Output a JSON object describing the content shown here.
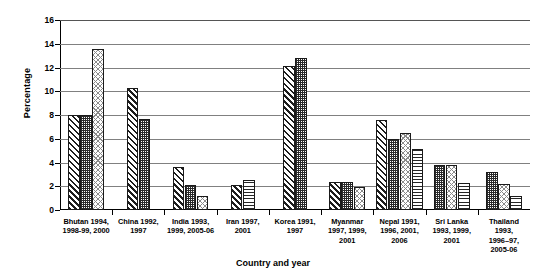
{
  "chart_data": {
    "type": "bar",
    "title": "",
    "xlabel": "Country and year",
    "ylabel": "Percentage",
    "ylim": [
      0,
      16
    ],
    "ytick_values": [
      0,
      2,
      4,
      6,
      8,
      10,
      12,
      14,
      16
    ],
    "ytick_labels": [
      "0",
      "2",
      "4",
      "6",
      "8",
      "10",
      "12",
      "14",
      "16"
    ],
    "grid": true,
    "legend": "none",
    "categories": [
      "Bhutan 1994, 1998-99, 2000",
      "China 1992, 1997",
      "India 1993, 1999, 2005-06",
      "Iran 1997, 2001",
      "Korea 1991, 1997",
      "Myanmar 1997, 1999, 2001",
      "Nepal 1991, 1996, 2001, 2006",
      "Sri Lanka 1993, 1999, 2001",
      "Thailand 1993, 1996–97, 2005-06"
    ],
    "category_label_lines": [
      [
        "Bhutan 1994,",
        "1998-99, 2000"
      ],
      [
        "China 1992,",
        "1997"
      ],
      [
        "India 1993,",
        "1999, 2005-06"
      ],
      [
        "Iran 1997,",
        "2001"
      ],
      [
        "Korea 1991,",
        "1997"
      ],
      [
        "Myanmar",
        "1997, 1999,",
        "2001"
      ],
      [
        "Nepal 1991,",
        "1996, 2001,",
        "2006"
      ],
      [
        "Sri Lanka",
        "1993, 1999,",
        "2001"
      ],
      [
        "Thailand",
        "1993,",
        "1996–97,",
        "2005-06"
      ]
    ],
    "groups": [
      {
        "category": "Bhutan 1994, 1998-99, 2000",
        "bars": [
          {
            "value": 8.0,
            "pattern": "diagonal-hatch"
          },
          {
            "value": 8.0,
            "pattern": "checkerboard"
          },
          {
            "value": 13.6,
            "pattern": "light-crosshatch"
          }
        ]
      },
      {
        "category": "China 1992, 1997",
        "bars": [
          {
            "value": 10.3,
            "pattern": "diagonal-hatch"
          },
          {
            "value": 7.7,
            "pattern": "checkerboard"
          }
        ]
      },
      {
        "category": "India 1993, 1999, 2005-06",
        "bars": [
          {
            "value": 3.6,
            "pattern": "diagonal-hatch"
          },
          {
            "value": 2.1,
            "pattern": "checkerboard"
          },
          {
            "value": 1.2,
            "pattern": "light-crosshatch"
          }
        ]
      },
      {
        "category": "Iran 1997, 2001",
        "bars": [
          {
            "value": 2.1,
            "pattern": "diagonal-hatch"
          },
          {
            "value": 2.5,
            "pattern": "horizontal-lines"
          }
        ]
      },
      {
        "category": "Korea 1991, 1997",
        "bars": [
          {
            "value": 12.1,
            "pattern": "diagonal-hatch"
          },
          {
            "value": 12.8,
            "pattern": "checkerboard"
          }
        ]
      },
      {
        "category": "Myanmar 1997, 1999, 2001",
        "bars": [
          {
            "value": 2.4,
            "pattern": "diagonal-hatch"
          },
          {
            "value": 2.4,
            "pattern": "checkerboard"
          },
          {
            "value": 1.9,
            "pattern": "light-crosshatch"
          }
        ]
      },
      {
        "category": "Nepal 1991, 1996, 2001, 2006",
        "bars": [
          {
            "value": 7.6,
            "pattern": "diagonal-hatch"
          },
          {
            "value": 6.0,
            "pattern": "checkerboard"
          },
          {
            "value": 6.5,
            "pattern": "light-crosshatch"
          },
          {
            "value": 5.1,
            "pattern": "horizontal-lines"
          }
        ]
      },
      {
        "category": "Sri Lanka 1993, 1999, 2001",
        "bars": [
          {
            "value": 3.8,
            "pattern": "checkerboard"
          },
          {
            "value": 3.8,
            "pattern": "light-crosshatch"
          },
          {
            "value": 2.3,
            "pattern": "horizontal-lines"
          }
        ]
      },
      {
        "category": "Thailand 1993, 1996–97, 2005-06",
        "bars": [
          {
            "value": 3.2,
            "pattern": "checkerboard"
          },
          {
            "value": 2.2,
            "pattern": "light-crosshatch"
          },
          {
            "value": 1.2,
            "pattern": "horizontal-lines"
          }
        ]
      }
    ],
    "colors": {
      "axis": "#000000",
      "gridline": "#808080",
      "bar_outline": "#1a1a1a",
      "background": "#ffffff"
    }
  }
}
